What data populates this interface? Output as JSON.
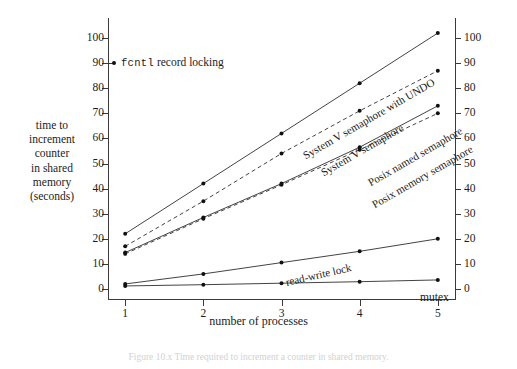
{
  "figure": {
    "caption": "Figure 10.x  Time required to increment a counter in shared memory.",
    "xlabel": "number of processes",
    "ylabel_lines": [
      "time to",
      "increment",
      "counter",
      "in shared",
      "memory",
      "(seconds)"
    ],
    "annotation": {
      "mono_text": "fcntl",
      "rest_text": " record locking",
      "at_value": 90
    }
  },
  "chart_data": {
    "type": "line",
    "title": "",
    "xlabel": "number of processes",
    "ylabel": "time to increment counter in shared memory (seconds)",
    "x": [
      1,
      2,
      3,
      4,
      5
    ],
    "xlim": [
      0.78,
      5.22
    ],
    "ylim": [
      -4,
      108
    ],
    "yticks_left": [
      0,
      10,
      20,
      30,
      40,
      50,
      60,
      70,
      80,
      90,
      100
    ],
    "yticks_right": [
      0,
      10,
      20,
      30,
      40,
      50,
      60,
      70,
      80,
      90,
      100
    ],
    "xticks": [
      1,
      2,
      3,
      4,
      5
    ],
    "grid": false,
    "legend": "inline-rotated-labels",
    "series": [
      {
        "name": "System V semaphore with UNDO",
        "values": [
          22,
          42,
          62,
          82,
          102
        ],
        "style": "solid",
        "color": "#2e2e2e",
        "label_angle": -30,
        "label_x": 196,
        "label_y": 133
      },
      {
        "name": "System V semaphore",
        "values": [
          17,
          35,
          54,
          71,
          87
        ],
        "style": "dashed",
        "color": "#2e2e2e",
        "label_angle": -30,
        "label_x": 214,
        "label_y": 150
      },
      {
        "name": "Posix named semaphore",
        "values": [
          14.5,
          28.5,
          42,
          56.5,
          73
        ],
        "style": "solid",
        "color": "#2e2e2e",
        "label_angle": -30,
        "label_x": 261,
        "label_y": 160
      },
      {
        "name": "Posix memory semaphore",
        "values": [
          14,
          28,
          41.5,
          55.5,
          70
        ],
        "style": "dashed",
        "color": "#2e2e2e",
        "label_angle": -30,
        "label_x": 265,
        "label_y": 182
      },
      {
        "name": "read-write lock",
        "values": [
          2,
          6,
          10.5,
          15,
          20
        ],
        "style": "solid",
        "color": "#2e2e2e",
        "label_angle": -13,
        "label_x": 178,
        "label_y": 259
      },
      {
        "name": "mutex",
        "values": [
          1.2,
          1.7,
          2.3,
          2.9,
          3.6
        ],
        "style": "solid",
        "color": "#2e2e2e",
        "label_angle": 0,
        "label_x": 312,
        "label_y": 274
      }
    ],
    "offscale_markers": [
      {
        "name": "fcntl record locking",
        "y": 90,
        "note": "value exceeds plotted range; marked at left axis"
      }
    ]
  }
}
